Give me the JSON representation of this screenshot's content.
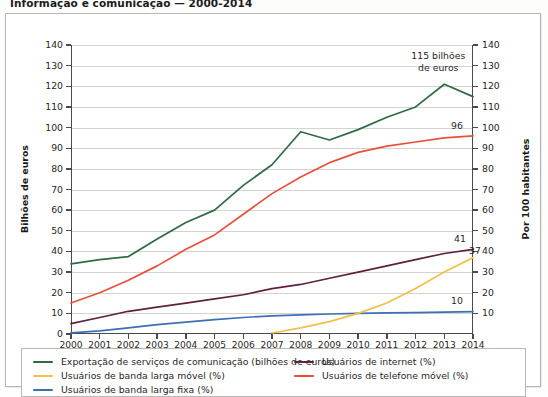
{
  "title": "Informação e comunicação — 2000-2014",
  "axis": {
    "left_title": "Bilhões de euros",
    "right_title": "Por 100 habitantes"
  },
  "annotations": {
    "peak_line1": "115 bilhões",
    "peak_line2": "de euros",
    "end_mobile_phone": "96",
    "end_internet": "41",
    "end_mobile_broadband": "37",
    "end_fixed_broadband": "10"
  },
  "legend": {
    "col1": [
      {
        "label": "Exportação de serviços de comunicação (bilhões de euros)",
        "color": "#2e6b42"
      },
      {
        "label": "Usuários de banda larga móvel (%)",
        "color": "#f0c04a"
      },
      {
        "label": "Usuários de banda larga fixa (%)",
        "color": "#3d6fb8"
      }
    ],
    "col2": [
      {
        "label": "Usuários de internet (%)",
        "color": "#5e2140"
      },
      {
        "label": "Usuários de telefone móvel (%)",
        "color": "#e8503a"
      }
    ]
  },
  "chart_data": {
    "type": "line",
    "title": "Informação e comunicação — 2000-2014",
    "xlabel": "",
    "ylabel": "Bilhões de euros",
    "ylabel_right": "Por 100 habitantes",
    "grid": true,
    "legend_position": "bottom",
    "x": [
      2000,
      2001,
      2002,
      2003,
      2004,
      2005,
      2006,
      2007,
      2008,
      2009,
      2010,
      2011,
      2012,
      2013,
      2014
    ],
    "ylim": [
      0,
      140
    ],
    "ylim_right": [
      0,
      140
    ],
    "yticks": [
      0,
      10,
      20,
      30,
      40,
      50,
      60,
      70,
      80,
      90,
      100,
      110,
      120,
      130,
      140
    ],
    "yticks_right": [
      10,
      20,
      30,
      40,
      50,
      60,
      70,
      80,
      90,
      100,
      110,
      120,
      130,
      140
    ],
    "series": [
      {
        "name": "Exportação de serviços de comunicação (bilhões de euros)",
        "color": "#2e6b42",
        "axis": "left",
        "unit": "bilhões de euros",
        "values": [
          34,
          36,
          37.5,
          46,
          54,
          60,
          72,
          82,
          98,
          94,
          99,
          105,
          110,
          121,
          115
        ]
      },
      {
        "name": "Usuários de telefone móvel (%)",
        "color": "#e8503a",
        "axis": "right",
        "unit": "%",
        "values": [
          15,
          20,
          26,
          33,
          41,
          48,
          58,
          68,
          76,
          83,
          88,
          91,
          93,
          95,
          96
        ]
      },
      {
        "name": "Usuários de internet (%)",
        "color": "#5e2140",
        "axis": "right",
        "unit": "%",
        "values": [
          5,
          8,
          11,
          13,
          15,
          17,
          19,
          22,
          24,
          27,
          30,
          33,
          36,
          39,
          41
        ]
      },
      {
        "name": "Usuários de banda larga móvel (%)",
        "color": "#f0c04a",
        "axis": "right",
        "unit": "%",
        "values": [
          null,
          null,
          null,
          null,
          null,
          null,
          null,
          0.5,
          3,
          6,
          10,
          15,
          22,
          30,
          37
        ]
      },
      {
        "name": "Usuários de banda larga fixa (%)",
        "color": "#3d6fb8",
        "axis": "right",
        "unit": "%",
        "values": [
          0.5,
          1.5,
          3,
          4.5,
          5.8,
          7,
          8,
          8.8,
          9.3,
          9.7,
          10,
          10.2,
          10.4,
          10.6,
          10.8
        ]
      }
    ]
  }
}
